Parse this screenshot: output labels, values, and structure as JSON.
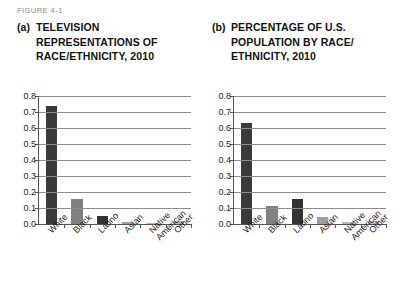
{
  "figure": {
    "label": "FIGURE 4-1"
  },
  "panels": [
    {
      "marker": "(a)",
      "title": "TELEVISION REPRESENTATIONS OF RACE/ETHNICITY, 2010"
    },
    {
      "marker": "(b)",
      "title": "PERCENTAGE OF U.S. POPULATION BY RACE/ ETHNICITY, 2010"
    }
  ],
  "caption": {
    "text": ""
  },
  "axis": {
    "yticks": [
      "0.0",
      "0.1",
      "0.2",
      "0.3",
      "0.4",
      "0.5",
      "0.6",
      "0.7",
      "0.8"
    ]
  },
  "colors": {
    "bar_dark": "#3a3a3a",
    "bar_mid": "#808080",
    "bar_light": "#9e9e9e",
    "bar_pale": "#bdbdbd",
    "axis": "#555555",
    "grid": "#8d8d8d",
    "text": "#1a1a1a",
    "figure_label": "#8a8a8a"
  },
  "chart_data": [
    {
      "type": "bar",
      "panel": "(a)",
      "title": "TELEVISION REPRESENTATIONS OF RACE/ETHNICITY, 2010",
      "xlabel": "",
      "ylabel": "",
      "ylim": [
        0,
        0.8
      ],
      "ytick_step": 0.1,
      "grid": true,
      "legend": "none",
      "categories": [
        "White",
        "Black",
        "Latino",
        "Asian",
        "Native American",
        "Other"
      ],
      "values": [
        0.74,
        0.155,
        0.05,
        0.015,
        0.005,
        0.02
      ],
      "bar_colors": [
        "#3a3a3a",
        "#808080",
        "#333333",
        "#9e9e9e",
        "#b5b5b5",
        "#bdbdbd"
      ]
    },
    {
      "type": "bar",
      "panel": "(b)",
      "title": "PERCENTAGE OF U.S. POPULATION BY RACE/ETHNICITY, 2010",
      "xlabel": "",
      "ylabel": "",
      "ylim": [
        0,
        0.8
      ],
      "ytick_step": 0.1,
      "grid": true,
      "legend": "none",
      "categories": [
        "White",
        "Black",
        "Latino",
        "Asian",
        "Native American",
        "Other"
      ],
      "values": [
        0.63,
        0.115,
        0.155,
        0.045,
        0.012,
        0.02
      ],
      "bar_colors": [
        "#3a3a3a",
        "#808080",
        "#333333",
        "#9e9e9e",
        "#b5b5b5",
        "#bdbdbd"
      ]
    }
  ]
}
